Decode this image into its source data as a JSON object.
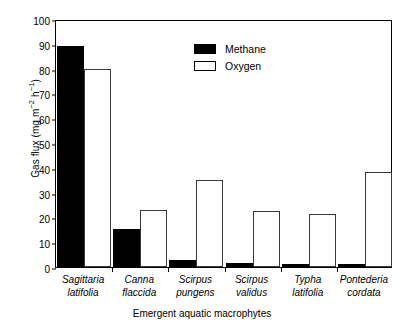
{
  "chart_data": {
    "type": "bar",
    "title": "",
    "xlabel": "Emergent aquatic macrophytes",
    "ylabel": "Gas flux (mg m⁻² h⁻¹)",
    "ylabel_parts": {
      "prefix": "Gas flux (mg m",
      "sup1": "−2",
      "mid": " h",
      "sup2": "−1",
      "suffix": ")"
    },
    "ylim": [
      0,
      100
    ],
    "ytick_step": 10,
    "yticks": [
      0,
      10,
      20,
      30,
      40,
      50,
      60,
      70,
      80,
      90,
      100
    ],
    "grid": false,
    "legend_position": "upper-center",
    "categories": [
      "Sagittaria latifolia",
      "Canna flaccida",
      "Scirpus pungens",
      "Scirpus validus",
      "Typha latifolia",
      "Pontederia cordata"
    ],
    "category_lines": [
      {
        "line1": "Sagittaria",
        "line2": "latifolia"
      },
      {
        "line1": "Canna",
        "line2": "flaccida"
      },
      {
        "line1": "Scirpus",
        "line2": "pungens"
      },
      {
        "line1": "Scirpus",
        "line2": "validus"
      },
      {
        "line1": "Typha",
        "line2": "latifolia"
      },
      {
        "line1": "Pontederia",
        "line2": "cordata"
      }
    ],
    "series": [
      {
        "name": "Methane",
        "color": "#000000",
        "fill": "solid",
        "values": [
          89,
          15.5,
          3,
          1.5,
          1.3,
          1.2
        ]
      },
      {
        "name": "Oxygen",
        "color": "#ffffff",
        "fill": "open",
        "values": [
          80,
          23,
          35,
          22.5,
          21.5,
          38.5
        ]
      }
    ]
  },
  "legend": {
    "entries": [
      {
        "label": "Methane"
      },
      {
        "label": "Oxygen"
      }
    ]
  }
}
